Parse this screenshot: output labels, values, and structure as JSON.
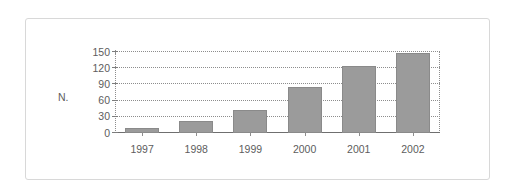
{
  "chart_data": {
    "type": "bar",
    "title": "",
    "subtitle": "",
    "xlabel": "",
    "ylabel": "N.",
    "categories": [
      "1997",
      "1998",
      "1999",
      "2000",
      "2001",
      "2002"
    ],
    "values": [
      10,
      22,
      43,
      85,
      125,
      148
    ],
    "series": [
      {
        "name": "N.",
        "values": [
          10,
          22,
          43,
          85,
          125,
          148
        ]
      }
    ],
    "ylim": [
      0,
      150
    ],
    "ytick_labels": [
      "0",
      "30",
      "60",
      "90",
      "120",
      "150"
    ],
    "ytick_values": [
      0,
      30,
      60,
      90,
      120,
      150
    ],
    "grid": "horizontal-dotted",
    "legend": "none",
    "colors": {
      "bar_fill": "#9b9b9b",
      "bar_border": "#8a8a8a",
      "gridline": "#8d8d8d",
      "axis": "#6f6f6f",
      "text": "#5d5d5d",
      "frame_border": "#d8d8d8",
      "background": "#ffffff"
    }
  }
}
